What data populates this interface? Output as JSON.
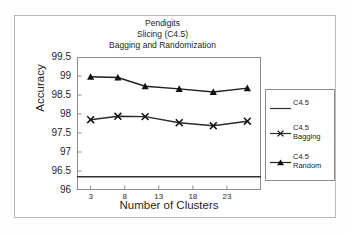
{
  "chart_data": {
    "type": "line",
    "title": "Pendigits\nSlicing (C4.5)\nBagging and Randomization",
    "title_lines": [
      "Pendigits",
      "Slicing (C4.5)",
      "Bagging and Randomization"
    ],
    "xlabel": "Number of Clusters",
    "ylabel": "Accuracy",
    "xlim": [
      1,
      28
    ],
    "ylim": [
      96,
      99.5
    ],
    "yticks": [
      96,
      96.5,
      97,
      97.5,
      98,
      98.5,
      99,
      99.5
    ],
    "ytick_labels": [
      "96",
      "96.5",
      "97",
      "97.5",
      "98",
      "98.5",
      "99",
      "99.5"
    ],
    "xticks": [
      3,
      8,
      13,
      18,
      23
    ],
    "xtick_labels": [
      "3",
      "8",
      "13",
      "18",
      "23"
    ],
    "grid": false,
    "legend_position": "right-outside",
    "x": [
      3,
      7,
      11,
      16,
      21,
      26
    ],
    "series": [
      {
        "name": "C4.5",
        "legend_label_lines": [
          "C4.5"
        ],
        "marker": "none",
        "style": "horizontal-baseline",
        "constant_value": 96.35,
        "values": [
          96.35,
          96.35,
          96.35,
          96.35,
          96.35,
          96.35
        ],
        "color": "#333333"
      },
      {
        "name": "C4.5 Bagging",
        "legend_label_lines": [
          "C4.5",
          "Bagging"
        ],
        "marker": "x",
        "values": [
          97.85,
          97.94,
          97.93,
          97.77,
          97.69,
          97.81
        ],
        "color": "#2b2b2b"
      },
      {
        "name": "C4.5 Random",
        "legend_label_lines": [
          "C4.5",
          "Random"
        ],
        "marker": "triangle",
        "values": [
          98.98,
          98.96,
          98.73,
          98.66,
          98.58,
          98.68
        ],
        "color": "#1e1e1e"
      }
    ]
  },
  "colors": {
    "background": "#ffffff",
    "frame": "#b9b9b9",
    "axis": "#8d8d8d",
    "ink": "#1f1f1f"
  }
}
